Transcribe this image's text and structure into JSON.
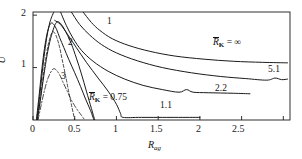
{
  "figure": {
    "background": "#ffffff",
    "line_color": "#1a1a1a",
    "frame": {
      "left": 33,
      "right": 290,
      "top": 12,
      "bottom": 120
    }
  },
  "axes": {
    "y_title": "U",
    "y_title_overbar": true,
    "x_title": "R",
    "x_title_sub": "ag",
    "y_ticks": [
      {
        "value": 1,
        "label": "1"
      },
      {
        "value": 2,
        "label": "2"
      }
    ],
    "x_ticks": [
      {
        "value": 0,
        "label": "0"
      },
      {
        "value": 0.5,
        "label": "0.5"
      },
      {
        "value": 1,
        "label": "1"
      },
      {
        "value": 1.5,
        "label": "1.5"
      },
      {
        "value": 2,
        "label": "2"
      },
      {
        "value": 2.5,
        "label": "2.5"
      },
      {
        "value": 3,
        "label": ""
      }
    ],
    "xlim": [
      0,
      3.08
    ],
    "ylim": [
      0,
      2.06
    ]
  },
  "annotations": {
    "curve_1": "1",
    "curve_2": "2",
    "curve_3": "3",
    "rk_infinity_prefix": "R",
    "rk_infinity_sub": "K",
    "rk_infinity_eq": " = ∞",
    "label_5_1": "5.1",
    "label_2_2": "2.2",
    "label_1_1": "1.1",
    "rk_075_prefix": "R",
    "rk_075_sub": "K",
    "rk_075_eq": " = 0.75"
  },
  "chart_data": {
    "type": "line",
    "title": "",
    "xlabel": "R_ag",
    "ylabel": "Ū",
    "xlim": [
      0,
      3.08
    ],
    "ylim": [
      0,
      2.06
    ],
    "grid": false,
    "legend": "inline-curve-labels",
    "series": [
      {
        "name": "R̄_K = ∞",
        "style": "solid",
        "label": "R̄_K = ∞",
        "points": [
          [
            0.045,
            0.0
          ],
          [
            0.08,
            0.45
          ],
          [
            0.11,
            0.9
          ],
          [
            0.14,
            1.3
          ],
          [
            0.17,
            1.62
          ],
          [
            0.2,
            1.85
          ],
          [
            0.225,
            1.97
          ],
          [
            0.25,
            2.06
          ]
        ],
        "comment": "rises off the top of the frame"
      },
      {
        "name": "branch-upper-a",
        "style": "solid",
        "label": "1",
        "points": [
          [
            0.6,
            2.06
          ],
          [
            0.7,
            1.86
          ],
          [
            0.8,
            1.71
          ],
          [
            0.95,
            1.55
          ],
          [
            1.15,
            1.42
          ],
          [
            1.4,
            1.31
          ],
          [
            1.7,
            1.22
          ],
          [
            2.05,
            1.16
          ],
          [
            2.4,
            1.12
          ],
          [
            2.75,
            1.1
          ],
          [
            3.05,
            1.09
          ]
        ]
      },
      {
        "name": "branch-upper-b",
        "style": "solid",
        "label": "5.1",
        "points": [
          [
            0.46,
            2.06
          ],
          [
            0.56,
            1.82
          ],
          [
            0.68,
            1.62
          ],
          [
            0.82,
            1.44
          ],
          [
            1.0,
            1.28
          ],
          [
            1.25,
            1.13
          ],
          [
            1.55,
            1.0
          ],
          [
            1.9,
            0.9
          ],
          [
            2.25,
            0.83
          ],
          [
            2.55,
            0.79
          ],
          [
            2.8,
            0.76
          ],
          [
            2.9,
            0.8
          ],
          [
            2.98,
            0.77
          ],
          [
            3.05,
            0.78
          ]
        ]
      },
      {
        "name": "branch-mid",
        "style": "solid",
        "label": "2.2",
        "points": [
          [
            0.33,
            2.06
          ],
          [
            0.4,
            1.8
          ],
          [
            0.48,
            1.56
          ],
          [
            0.58,
            1.33
          ],
          [
            0.72,
            1.12
          ],
          [
            0.9,
            0.93
          ],
          [
            1.1,
            0.78
          ],
          [
            1.32,
            0.66
          ],
          [
            1.55,
            0.58
          ],
          [
            1.75,
            0.53
          ],
          [
            1.84,
            0.58
          ],
          [
            1.92,
            0.53
          ],
          [
            2.1,
            0.52
          ],
          [
            2.4,
            0.51
          ],
          [
            2.6,
            0.5
          ]
        ]
      },
      {
        "name": "branch-low",
        "style": "solid",
        "label": "1.1",
        "points": [
          [
            0.26,
            1.9
          ],
          [
            0.33,
            1.82
          ],
          [
            0.42,
            1.62
          ],
          [
            0.52,
            1.38
          ],
          [
            0.64,
            1.1
          ],
          [
            0.78,
            0.8
          ],
          [
            0.9,
            0.55
          ],
          [
            1.0,
            0.3
          ],
          [
            1.05,
            0.12
          ],
          [
            1.08,
            0.05
          ],
          [
            1.3,
            0.05
          ],
          [
            1.7,
            0.05
          ],
          [
            2.0,
            0.05
          ]
        ]
      },
      {
        "name": "R̄_K = 0.75",
        "style": "solid",
        "label": "R̄_K = 0.75",
        "points": [
          [
            0.05,
            0.0
          ],
          [
            0.09,
            0.4
          ],
          [
            0.13,
            0.85
          ],
          [
            0.17,
            1.25
          ],
          [
            0.21,
            1.55
          ],
          [
            0.25,
            1.76
          ],
          [
            0.28,
            1.86
          ],
          [
            0.31,
            1.87
          ],
          [
            0.35,
            1.8
          ],
          [
            0.4,
            1.66
          ],
          [
            0.46,
            1.45
          ],
          [
            0.52,
            1.18
          ],
          [
            0.58,
            0.88
          ],
          [
            0.64,
            0.55
          ],
          [
            0.7,
            0.22
          ],
          [
            0.74,
            0.0
          ]
        ]
      },
      {
        "name": "curve-2",
        "style": "dashed",
        "label": "2",
        "points": [
          [
            0.055,
            0.0
          ],
          [
            0.09,
            0.42
          ],
          [
            0.12,
            0.82
          ],
          [
            0.15,
            1.15
          ],
          [
            0.18,
            1.42
          ],
          [
            0.21,
            1.6
          ],
          [
            0.235,
            1.68
          ],
          [
            0.26,
            1.66
          ],
          [
            0.29,
            1.55
          ],
          [
            0.32,
            1.38
          ],
          [
            0.35,
            1.15
          ],
          [
            0.39,
            0.85
          ],
          [
            0.43,
            0.52
          ],
          [
            0.47,
            0.22
          ],
          [
            0.5,
            0.0
          ]
        ]
      },
      {
        "name": "curve-3",
        "style": "dashdot",
        "label": "3",
        "points": [
          [
            0.06,
            0.0
          ],
          [
            0.1,
            0.3
          ],
          [
            0.14,
            0.58
          ],
          [
            0.18,
            0.8
          ],
          [
            0.22,
            0.93
          ],
          [
            0.25,
            0.98
          ],
          [
            0.28,
            0.95
          ],
          [
            0.32,
            0.86
          ],
          [
            0.36,
            0.72
          ],
          [
            0.41,
            0.55
          ],
          [
            0.46,
            0.38
          ],
          [
            0.52,
            0.22
          ],
          [
            0.58,
            0.09
          ],
          [
            0.62,
            0.0
          ]
        ]
      },
      {
        "name": "rising-left-envelope",
        "style": "solid",
        "label": "",
        "points": [
          [
            0.04,
            0.0
          ],
          [
            0.07,
            0.42
          ],
          [
            0.1,
            0.88
          ],
          [
            0.13,
            1.28
          ],
          [
            0.16,
            1.58
          ],
          [
            0.19,
            1.77
          ],
          [
            0.22,
            1.85
          ],
          [
            0.25,
            1.82
          ],
          [
            0.285,
            1.72
          ],
          [
            0.32,
            1.57
          ],
          [
            0.37,
            1.38
          ],
          [
            0.43,
            1.15
          ],
          [
            0.5,
            0.9
          ],
          [
            0.57,
            0.64
          ],
          [
            0.63,
            0.4
          ],
          [
            0.69,
            0.18
          ],
          [
            0.73,
            0.0
          ]
        ]
      }
    ]
  }
}
